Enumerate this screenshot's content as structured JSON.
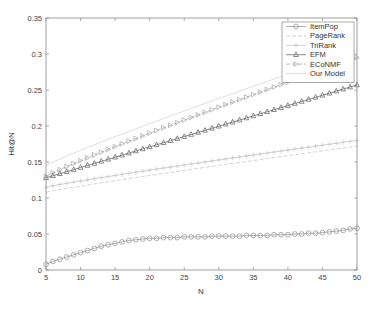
{
  "chart_data": {
    "type": "line",
    "title": "",
    "xlabel": "N",
    "ylabel": "Hit@N",
    "xlim": [
      5,
      50
    ],
    "ylim": [
      0,
      0.35
    ],
    "xticks": [
      5,
      10,
      15,
      20,
      25,
      30,
      35,
      40,
      45,
      50
    ],
    "xtick_labels": [
      "5",
      "10",
      "15",
      "20",
      "25",
      "30",
      "35",
      "40",
      "45",
      "50"
    ],
    "yticks": [
      0,
      0.05,
      0.1,
      0.15,
      0.2,
      0.25,
      0.3,
      0.35
    ],
    "ytick_labels": [
      "0",
      "0.05",
      "0.1",
      "0.15",
      "0.2",
      "0.25",
      "0.3",
      "0.35"
    ],
    "grid": false,
    "legend_position": "upper right",
    "x": [
      5,
      6,
      7,
      8,
      9,
      10,
      11,
      12,
      13,
      14,
      15,
      16,
      17,
      18,
      19,
      20,
      21,
      22,
      23,
      24,
      25,
      26,
      27,
      28,
      29,
      30,
      31,
      32,
      33,
      34,
      35,
      36,
      37,
      38,
      39,
      40,
      41,
      42,
      43,
      44,
      45,
      46,
      47,
      48,
      49,
      50
    ],
    "series": [
      {
        "name": "ItemPop",
        "marker": "circle",
        "dash": "solid",
        "color": "#9a9a9a",
        "start": 0.008,
        "end": 0.058,
        "values": [
          0.008,
          0.012,
          0.015,
          0.018,
          0.021,
          0.024,
          0.027,
          0.03,
          0.033,
          0.035,
          0.037,
          0.039,
          0.041,
          0.042,
          0.043,
          0.044,
          0.044,
          0.045,
          0.045,
          0.045,
          0.046,
          0.046,
          0.046,
          0.046,
          0.047,
          0.047,
          0.047,
          0.047,
          0.047,
          0.048,
          0.048,
          0.048,
          0.048,
          0.049,
          0.049,
          0.049,
          0.05,
          0.05,
          0.051,
          0.051,
          0.052,
          0.053,
          0.054,
          0.055,
          0.057,
          0.058
        ]
      },
      {
        "name": "PageRank",
        "marker": "none",
        "dash": "dashed",
        "color": "#c8c8c8",
        "start": 0.108,
        "end": 0.172
      },
      {
        "name": "TriRank",
        "marker": "plus",
        "dash": "solid",
        "color": "#c8c8c8",
        "start": 0.115,
        "end": 0.18
      },
      {
        "name": "EFM",
        "marker": "triangle-up",
        "dash": "solid",
        "color": "#6e6e6e",
        "start": 0.128,
        "end": 0.257
      },
      {
        "name": "ECoNMF",
        "marker": "triangle-right",
        "dash": "dashed",
        "color": "#a8a8a8",
        "start": 0.13,
        "end": 0.295
      },
      {
        "name": "Our Model",
        "marker": "none",
        "dash": "solid",
        "color": "#d6d6d6",
        "start": 0.145,
        "end": 0.305
      }
    ]
  },
  "legend": {
    "items": [
      "ItemPop",
      "PageRank",
      "TriRank",
      "EFM",
      "ECoNMF",
      "Our Model"
    ]
  }
}
